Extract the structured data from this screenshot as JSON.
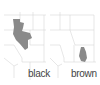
{
  "panels": [
    {
      "label": "black",
      "fill_color": "#8a8a8a"
    },
    {
      "label": "brown",
      "fill_color": "#8a8a8a"
    }
  ],
  "colors": {
    "boundary": "#d6d6d6",
    "background": "#ffffff",
    "text": "#444444"
  }
}
